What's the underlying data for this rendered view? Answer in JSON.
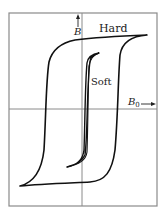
{
  "figure": {
    "type": "hysteresis-loop-diagram",
    "curves": [
      {
        "name": "hard",
        "label": "Hard"
      },
      {
        "name": "soft",
        "label": "Soft"
      }
    ],
    "axes": {
      "vertical": {
        "label": "B"
      },
      "horizontal": {
        "label": "B",
        "subscript": "0"
      }
    },
    "colors": {
      "curve": "#111111",
      "axis": "#8a8a8a",
      "frame": "#8a8a8a",
      "background": "#ffffff"
    }
  }
}
